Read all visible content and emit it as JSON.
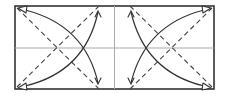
{
  "diagram": {
    "elements": {
      "paper": "rectangle",
      "horizontal_crease": "center crease line",
      "vertical_crease": "center crease line",
      "left_valley_folds": [
        "diagonal from top-left corner",
        "diagonal from bottom-left corner"
      ],
      "right_valley_folds": [
        "diagonal from top-right corner",
        "diagonal from bottom-right corner"
      ],
      "arrows": [
        "left corners fold to left-inner vertical line (top)",
        "left corners fold to left-inner vertical line (bottom)",
        "right corners fold to right-inner vertical line (top)",
        "right corners fold to right-inner vertical line (bottom)"
      ]
    },
    "colors": {
      "outline": "#333333",
      "crease": "#aaaaaa",
      "valley": "#444444"
    }
  }
}
